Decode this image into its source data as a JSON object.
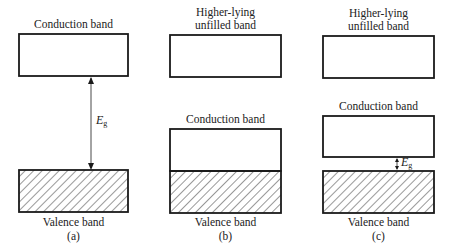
{
  "panels": [
    {
      "id": "a",
      "caption": "(a)",
      "top_band_label": "Conduction band",
      "bottom_band_label": "Valence band",
      "gap_label": "E",
      "gap_subscript": "g"
    },
    {
      "id": "b",
      "caption": "(b)",
      "top_band_label_line1": "Higher-lying",
      "top_band_label_line2": "unfilled band",
      "middle_band_label": "Conduction band",
      "bottom_band_label": "Valence band"
    },
    {
      "id": "c",
      "caption": "(c)",
      "top_band_label_line1": "Higher-lying",
      "top_band_label_line2": "unfilled band",
      "middle_band_label": "Conduction band",
      "bottom_band_label": "Valence band",
      "gap_label": "E",
      "gap_subscript": "g"
    }
  ],
  "colors": {
    "stroke": "#1a1a1a",
    "hatch": "#333333",
    "background": "#ffffff"
  }
}
